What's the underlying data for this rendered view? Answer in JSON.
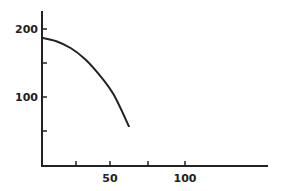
{
  "chart_data": {
    "type": "line",
    "title": "",
    "xlabel": "",
    "ylabel": "",
    "xlim": [
      0,
      160
    ],
    "ylim": [
      0,
      225
    ],
    "x_ticks": [
      25,
      50,
      75,
      100
    ],
    "x_tick_labels": [
      "",
      "50",
      "",
      "100"
    ],
    "y_ticks": [
      50,
      100,
      150,
      200
    ],
    "y_tick_labels": [
      "",
      "100",
      "",
      "200"
    ],
    "grid": false,
    "legend": null,
    "series": [
      {
        "name": "curve",
        "x": [
          0,
          10,
          20,
          30,
          40,
          50,
          61
        ],
        "y": [
          187,
          182,
          172,
          156,
          133,
          104,
          56
        ]
      }
    ]
  },
  "labels": {
    "y200": "200",
    "y100": "100",
    "x50": "50",
    "x100": "100"
  }
}
